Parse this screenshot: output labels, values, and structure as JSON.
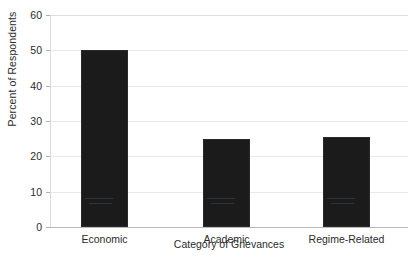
{
  "chart_data": {
    "type": "bar",
    "title": "",
    "xlabel": "Category of Grievances",
    "ylabel": "Percent of Respondents",
    "categories": [
      "Economic",
      "Academic",
      "Regime-Related"
    ],
    "values": [
      50,
      25,
      25.5
    ],
    "ylim": [
      0,
      60
    ],
    "ytick_step": 10,
    "yticks": [
      "0",
      "10",
      "20",
      "30",
      "40",
      "50",
      "60"
    ],
    "grid": "horizontal",
    "legend": "none",
    "bar_color": "#1b1b1b",
    "gridline_color": "#e9e9e9",
    "axis_color": "#b8b8b8",
    "text_color": "#2b2b2b",
    "background": "#ffffff",
    "bars": [
      {
        "category": "Economic",
        "value": 50
      },
      {
        "category": "Academic",
        "value": 25
      },
      {
        "category": "Regime-Related",
        "value": 25.5
      }
    ]
  }
}
